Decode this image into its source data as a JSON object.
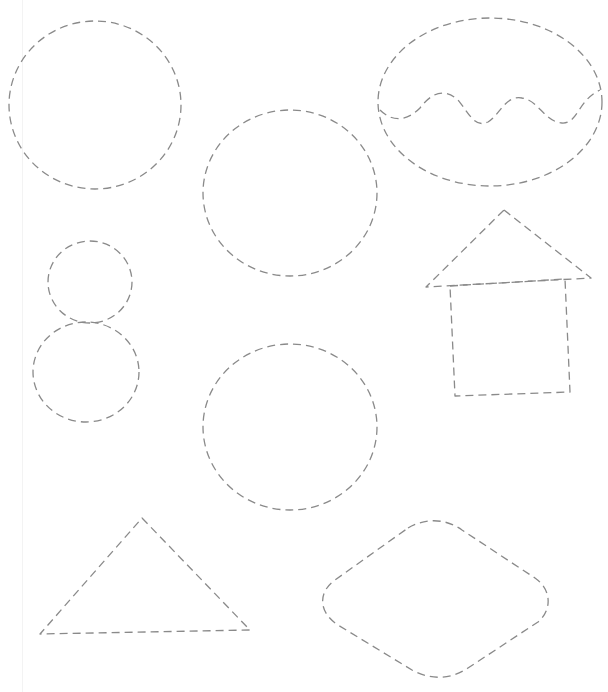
{
  "page": {
    "background": "#ffffff"
  },
  "style": {
    "stroke_color": "#8a8a8a",
    "stroke_width": 1.3,
    "dash_pattern": "8 5"
  },
  "shapes": [
    {
      "id": "circle-large-top-left",
      "type": "ellipse",
      "cx": 95,
      "cy": 105,
      "rx": 86,
      "ry": 84
    },
    {
      "id": "circle-center-top",
      "type": "ellipse",
      "cx": 290,
      "cy": 193,
      "rx": 87,
      "ry": 83
    },
    {
      "id": "ellipse-with-wave",
      "type": "ellipse",
      "cx": 490,
      "cy": 102,
      "rx": 112,
      "ry": 84
    },
    {
      "id": "wave-line",
      "type": "path",
      "d": "M380,110 C395,125 410,118 420,108 C432,92 445,88 458,100 C470,115 475,128 488,122 C500,115 505,95 522,98 C538,100 545,122 562,123 C578,124 578,100 600,90"
    },
    {
      "id": "circle-small-upper",
      "type": "ellipse",
      "cx": 90,
      "cy": 282,
      "rx": 42,
      "ry": 41
    },
    {
      "id": "circle-small-lower",
      "type": "ellipse",
      "cx": 86,
      "cy": 372,
      "rx": 53,
      "ry": 50
    },
    {
      "id": "house-roof",
      "type": "path",
      "d": "M504,210 L591,278 L426,287 Z"
    },
    {
      "id": "house-body",
      "type": "path",
      "d": "M450,286 L565,279 L570,392 L455,396 Z"
    },
    {
      "id": "circle-center-bottom",
      "type": "ellipse",
      "cx": 290,
      "cy": 427,
      "rx": 87,
      "ry": 83
    },
    {
      "id": "triangle",
      "type": "path",
      "d": "M142,518 L250,630 L40,634 Z"
    },
    {
      "id": "rounded-rhombus",
      "type": "path",
      "d": "M408,528 C425,518 445,518 462,530 L535,578 C552,590 552,610 538,622 L468,668 C450,680 430,680 412,670 L338,625 C318,612 318,592 335,580 Z"
    }
  ]
}
